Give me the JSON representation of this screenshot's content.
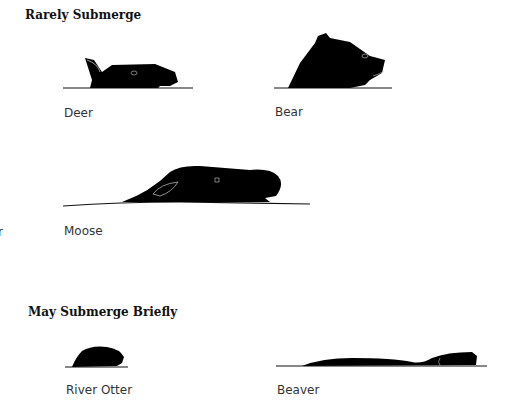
{
  "sections": [
    {
      "title": "Rarely Submerge",
      "animals": [
        {
          "name": "Deer"
        },
        {
          "name": "Bear"
        },
        {
          "name": "Moose"
        }
      ]
    },
    {
      "title": "May Submerge Briefly",
      "animals": [
        {
          "name": "River Otter"
        },
        {
          "name": "Beaver"
        }
      ]
    }
  ],
  "edge_fragment": "r",
  "colors": {
    "silhouette": "#000000",
    "waterline": "#111111",
    "text": "#333333"
  }
}
